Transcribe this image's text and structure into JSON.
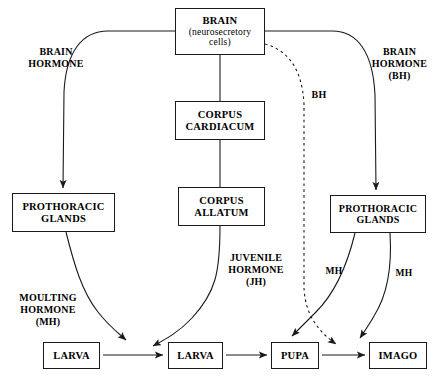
{
  "diagram": {
    "nodes": [
      {
        "id": "brain",
        "line1": "BRAIN",
        "line2": "(neurosecretory\ncells)"
      },
      {
        "id": "corpus-cardiacum",
        "line1": "CORPUS\nCARDIACUM"
      },
      {
        "id": "corpus-allatum",
        "line1": "CORPUS\nALLATUM"
      },
      {
        "id": "prothoracic-left",
        "line1": "PROTHORACIC\nGLANDS"
      },
      {
        "id": "prothoracic-right",
        "line1": "PROTHORACIC\nGLANDS"
      },
      {
        "id": "larva-1",
        "line1": "LARVA"
      },
      {
        "id": "larva-2",
        "line1": "LARVA"
      },
      {
        "id": "pupa",
        "line1": "PUPA"
      },
      {
        "id": "imago",
        "line1": "IMAGO"
      }
    ],
    "labels": [
      {
        "id": "brain-hormone-left",
        "text": "BRAIN\nHORMONE"
      },
      {
        "id": "brain-hormone-right",
        "text": "BRAIN\nHORMONE\n(BH)"
      },
      {
        "id": "bh",
        "text": "BH"
      },
      {
        "id": "moulting-hormone",
        "text": "MOULTING\nHORMONE\n(MH)"
      },
      {
        "id": "juvenile-hormone",
        "text": "JUVENILE\nHORMONE\n(JH)"
      },
      {
        "id": "mh-left",
        "text": "MH"
      },
      {
        "id": "mh-right",
        "text": "MH"
      }
    ],
    "colors": {
      "stroke": "#1a1a1a",
      "background": "#ffffff",
      "text": "#000000"
    }
  }
}
